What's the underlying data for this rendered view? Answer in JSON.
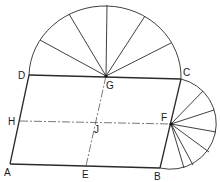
{
  "diagram": {
    "type": "geometric construction",
    "labels": {
      "A": "A",
      "B": "B",
      "C": "C",
      "D": "D",
      "E": "E",
      "F": "F",
      "G": "G",
      "H": "H",
      "J": "J"
    },
    "points": {
      "A": [
        10,
        164
      ],
      "B": [
        160,
        168
      ],
      "C": [
        181,
        79
      ],
      "D": [
        29,
        75
      ],
      "E": [
        86,
        166
      ],
      "F": [
        171,
        124
      ],
      "G": [
        106,
        76
      ],
      "H": [
        20,
        121
      ],
      "J": [
        96,
        122
      ]
    },
    "top_semicircle": {
      "center": "G",
      "sectors": 6
    },
    "right_semicircle": {
      "center": "F",
      "sectors": 8
    },
    "colors": {
      "line": "#2a2a2a",
      "text": "#1a1a1a",
      "background": "#ffffff"
    }
  }
}
